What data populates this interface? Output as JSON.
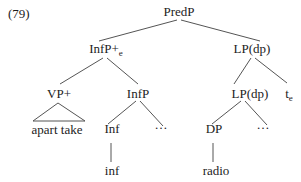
{
  "figure": {
    "number": "(79)"
  },
  "tree": {
    "root": {
      "label": "PredP"
    },
    "infp_plus": {
      "label": "InfP+",
      "sub": "e"
    },
    "lp_top": {
      "label": "LP(dp)"
    },
    "vp_plus": {
      "label": "VP+"
    },
    "infp": {
      "label": "InfP"
    },
    "lp_inner": {
      "label": "LP(dp)"
    },
    "trace": {
      "label": "t",
      "sub": "e"
    },
    "vp_leaf_words": {
      "label": "apart take"
    },
    "inf_head": {
      "label": "Inf"
    },
    "ellipsis_mid": {
      "label": "…"
    },
    "dp": {
      "label": "DP"
    },
    "ellipsis_right": {
      "label": "…"
    },
    "inf_leaf": {
      "label": "inf"
    },
    "dp_leaf": {
      "label": "radio"
    }
  }
}
